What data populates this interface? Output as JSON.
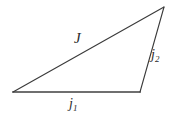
{
  "figure": {
    "background_color": "#ffffff",
    "width": 182,
    "height": 121
  },
  "chart_data": {
    "type": "diagram",
    "title": "",
    "subtitle": "",
    "xlabel": "",
    "ylabel": "",
    "vertices": [
      {
        "name": "left-vertex",
        "x": 13,
        "y": 92
      },
      {
        "name": "apex-vertex",
        "x": 164,
        "y": 7
      },
      {
        "name": "bottom-right-vertex",
        "x": 140,
        "y": 92
      }
    ],
    "edges": [
      {
        "name": "hypotenuse",
        "label": "J",
        "subscript": "",
        "from": "left-vertex",
        "to": "apex-vertex",
        "color": "#3a3a3a",
        "stroke_width": 1.1
      },
      {
        "name": "right-side",
        "label": "j",
        "subscript": "2",
        "from": "apex-vertex",
        "to": "bottom-right-vertex",
        "color": "#3a3a3a",
        "stroke_width": 1.1
      },
      {
        "name": "base",
        "label": "j",
        "subscript": "1",
        "from": "left-vertex",
        "to": "bottom-right-vertex",
        "color": "#6f6f6f",
        "stroke_width": 2.0
      }
    ],
    "labels": [
      {
        "name": "label-J",
        "text": "J",
        "subscript": "",
        "x": 78,
        "y": 40
      },
      {
        "name": "label-j2",
        "text": "j",
        "subscript": "2",
        "x": 156,
        "y": 55
      },
      {
        "name": "label-j1",
        "text": "j",
        "subscript": "1",
        "x": 74,
        "y": 104
      }
    ],
    "grid": false,
    "legend": false
  }
}
